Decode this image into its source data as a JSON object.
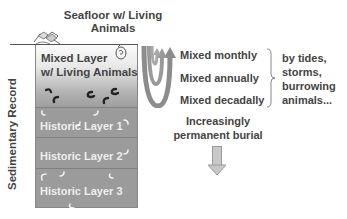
{
  "title": {
    "line1": "Seafloor w/ Living",
    "line2": "Animals"
  },
  "side_label": "Sedimentary Record",
  "mixed_layer": {
    "line1": "Mixed Layer",
    "line2": "w/ Living Animals"
  },
  "historic_layers": [
    {
      "label": "Historic Layer 1"
    },
    {
      "label": "Historic Layer 2"
    },
    {
      "label": "Historic Layer 3"
    }
  ],
  "mixing": [
    {
      "label": "Mixed monthly"
    },
    {
      "label": "Mixed annually"
    },
    {
      "label": "Mixed decadally"
    }
  ],
  "causes": {
    "line1": "by tides,",
    "line2": "storms,",
    "line3": "burrowing",
    "line4": "animals..."
  },
  "burial": {
    "line1": "Increasingly",
    "line2": "permanent burial"
  },
  "colors": {
    "layer_gray": "#9b9b9b",
    "arrow_gray": "#8c8c8c",
    "text": "#444444",
    "layer_text": "#eeeeee"
  }
}
